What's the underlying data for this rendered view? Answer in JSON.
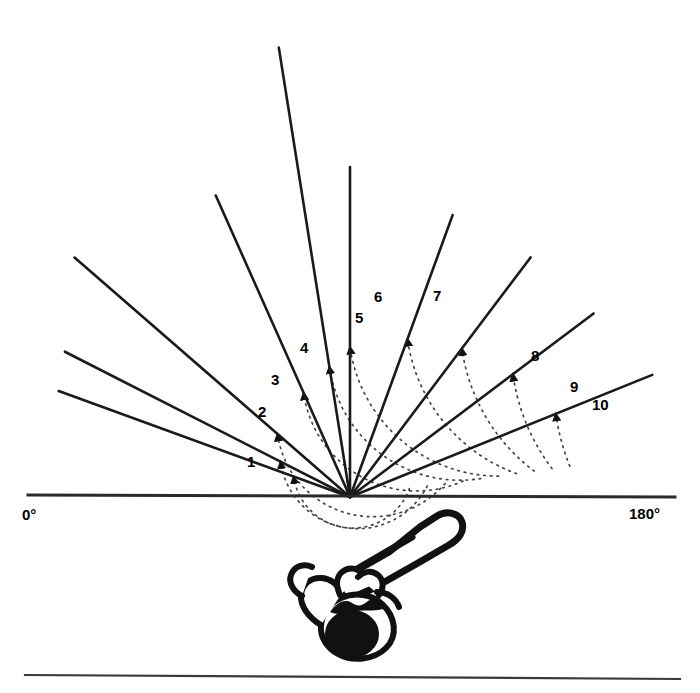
{
  "figure": {
    "vertex": {
      "x": 350,
      "y": 497
    },
    "baseline": {
      "y": 496,
      "x_start": 28,
      "x_end": 675
    },
    "bottom_rule": {
      "y": 677,
      "x_start": 25,
      "x_end": 680
    },
    "stroke_color": "#1a1a1a",
    "dotted_color": "#444444"
  },
  "axis_labels": {
    "left": {
      "text": "0°",
      "x": 22,
      "y": 506
    },
    "right": {
      "text": "180°",
      "x": 629,
      "y": 505
    }
  },
  "chart_data": {
    "type": "line",
    "xlabel": "",
    "ylabel": "",
    "angle_axis_min": 0,
    "angle_axis_max": 180,
    "grid": false,
    "legend_position": "none",
    "vertex": [
      350,
      497
    ],
    "categories": [
      "1",
      "2",
      "3",
      "4",
      "5",
      "6",
      "7",
      "8",
      "9",
      "10"
    ],
    "values": [
      22,
      37,
      53,
      70,
      90,
      99,
      114,
      139,
      153,
      160
    ],
    "series": [
      {
        "name": "rays",
        "values": [
          22,
          37,
          53,
          70,
          90,
          99,
          114,
          139,
          153,
          160
        ]
      },
      {
        "name": "arc_radius_px",
        "values": [
          222,
          204,
          186,
          168,
          150,
          132,
          114,
          96,
          78,
          60
        ]
      },
      {
        "name": "ray_length_px",
        "values": [
          326,
          305,
          300,
          300,
          330,
          455,
          330,
          365,
          320,
          310
        ]
      }
    ],
    "annotations": [
      {
        "label": "1",
        "angle_deg": 22,
        "x": 247,
        "y": 454
      },
      {
        "label": "2",
        "angle_deg": 37,
        "x": 258,
        "y": 404
      },
      {
        "label": "3",
        "angle_deg": 53,
        "x": 271,
        "y": 372
      },
      {
        "label": "4",
        "angle_deg": 70,
        "x": 300,
        "y": 340
      },
      {
        "label": "5",
        "angle_deg": 90,
        "x": 355,
        "y": 310
      },
      {
        "label": "6",
        "angle_deg": 99,
        "x": 374,
        "y": 289
      },
      {
        "label": "7",
        "angle_deg": 114,
        "x": 433,
        "y": 288
      },
      {
        "label": "8",
        "angle_deg": 139,
        "x": 531,
        "y": 348
      },
      {
        "label": "9",
        "angle_deg": 153,
        "x": 570,
        "y": 379
      },
      {
        "label": "10",
        "angle_deg": 160,
        "x": 592,
        "y": 397
      }
    ]
  },
  "rays": [
    {
      "id": "1",
      "angle_deg": 22,
      "length": 326,
      "label_x": 247,
      "label_y": 454,
      "arc_radius": 222
    },
    {
      "id": "2",
      "angle_deg": 37,
      "length": 305,
      "label_x": 258,
      "label_y": 404,
      "arc_radius": 204
    },
    {
      "id": "3",
      "angle_deg": 53,
      "length": 300,
      "label_x": 271,
      "label_y": 372,
      "arc_radius": 186
    },
    {
      "id": "4",
      "angle_deg": 70,
      "length": 300,
      "label_x": 300,
      "label_y": 340,
      "arc_radius": 168
    },
    {
      "id": "5",
      "angle_deg": 90,
      "length": 330,
      "label_x": 355,
      "label_y": 310,
      "arc_radius": 150
    },
    {
      "id": "6",
      "angle_deg": 99,
      "length": 455,
      "label_x": 374,
      "label_y": 289,
      "arc_radius": 132
    },
    {
      "id": "7",
      "angle_deg": 114,
      "length": 330,
      "label_x": 433,
      "label_y": 288,
      "arc_radius": 114
    },
    {
      "id": "8",
      "angle_deg": 139,
      "length": 365,
      "label_x": 531,
      "label_y": 348,
      "arc_radius": 96
    },
    {
      "id": "9",
      "angle_deg": 153,
      "length": 320,
      "label_x": 570,
      "label_y": 379,
      "arc_radius": 78
    },
    {
      "id": "10",
      "angle_deg": 160,
      "length": 310,
      "label_x": 592,
      "label_y": 397,
      "arc_radius": 60
    }
  ],
  "illustration": {
    "name": "overhead-view-batter-with-bat",
    "description": "Top-down silhouette of a person gripping a bat",
    "bounds": {
      "x": 280,
      "y": 508,
      "width": 180,
      "height": 160
    }
  }
}
